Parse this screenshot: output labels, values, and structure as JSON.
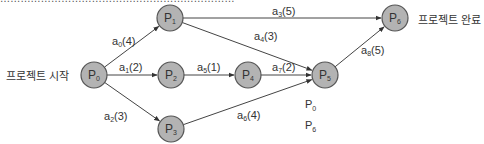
{
  "diagram": {
    "type": "activity-network",
    "start_label": "프로젝트 시작",
    "end_label": "프로젝트 완료",
    "nodes": [
      {
        "id": "P0",
        "base": "P",
        "sub": "0",
        "cx": 94,
        "cy": 75
      },
      {
        "id": "P1",
        "base": "P",
        "sub": "1",
        "cx": 170,
        "cy": 18
      },
      {
        "id": "P2",
        "base": "P",
        "sub": "2",
        "cx": 171,
        "cy": 75
      },
      {
        "id": "P3",
        "base": "P",
        "sub": "3",
        "cx": 171,
        "cy": 129
      },
      {
        "id": "P4",
        "base": "P",
        "sub": "4",
        "cx": 248,
        "cy": 75
      },
      {
        "id": "P5",
        "base": "P",
        "sub": "5",
        "cx": 325,
        "cy": 75
      },
      {
        "id": "P6",
        "base": "P",
        "sub": "6",
        "cx": 395,
        "cy": 18
      }
    ],
    "edges": [
      {
        "id": "a0",
        "from": "P0",
        "to": "P1",
        "base": "a",
        "sub": "0",
        "weight": "(4)",
        "lx": 112,
        "ly": 45
      },
      {
        "id": "a1",
        "from": "P0",
        "to": "P2",
        "base": "a",
        "sub": "1",
        "weight": "(2)",
        "lx": 119,
        "ly": 71
      },
      {
        "id": "a2",
        "from": "P0",
        "to": "P3",
        "base": "a",
        "sub": "2",
        "weight": "(3)",
        "lx": 104,
        "ly": 120
      },
      {
        "id": "a3",
        "from": "P1",
        "to": "P6",
        "base": "a",
        "sub": "3",
        "weight": "(5)",
        "lx": 272,
        "ly": 15
      },
      {
        "id": "a4",
        "from": "P1",
        "to": "P5",
        "base": "a",
        "sub": "4",
        "weight": "(3)",
        "lx": 254,
        "ly": 40
      },
      {
        "id": "a5",
        "from": "P2",
        "to": "P4",
        "base": "a",
        "sub": "5",
        "weight": "(1)",
        "lx": 197,
        "ly": 71
      },
      {
        "id": "a6",
        "from": "P3",
        "to": "P5",
        "base": "a",
        "sub": "6",
        "weight": "(4)",
        "lx": 237,
        "ly": 119
      },
      {
        "id": "a7",
        "from": "P4",
        "to": "P5",
        "base": "a",
        "sub": "7",
        "weight": "(2)",
        "lx": 272,
        "ly": 71
      },
      {
        "id": "a8",
        "from": "P5",
        "to": "P6",
        "base": "a",
        "sub": "8",
        "weight": "(5)",
        "lx": 361,
        "ly": 54
      }
    ],
    "legend": [
      {
        "base": "P",
        "sub": "0"
      },
      {
        "base": "P",
        "sub": "6"
      }
    ]
  },
  "clipped_header_text": "……………………………………………………………"
}
